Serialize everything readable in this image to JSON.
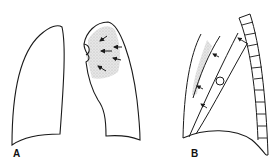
{
  "figure": {
    "panels": [
      {
        "id": "A",
        "label": "A"
      },
      {
        "id": "B",
        "label": "B"
      }
    ],
    "colors": {
      "stroke": "#1a1a1a",
      "shading": "#d6d6d6",
      "background": "#ffffff"
    }
  }
}
